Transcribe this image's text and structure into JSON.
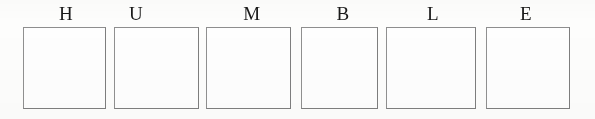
{
  "worksheet": {
    "background_color": "#fdfdfc",
    "border_color": "#8a8a8a",
    "text_color": "#1a1a1a",
    "word": "HUMBLE",
    "slots": [
      {
        "letter": "H",
        "box_value": "",
        "letter_left": 55,
        "letter_width": 22,
        "letter_top": 4,
        "box_left": 23,
        "box_top": 27,
        "box_width": 83,
        "box_height": 82
      },
      {
        "letter": "U",
        "box_value": "",
        "letter_left": 125,
        "letter_width": 22,
        "letter_top": 4,
        "box_left": 114,
        "box_top": 27,
        "box_width": 85,
        "box_height": 82
      },
      {
        "letter": "M",
        "box_value": "",
        "letter_left": 239,
        "letter_width": 26,
        "letter_top": 4,
        "box_left": 206,
        "box_top": 27,
        "box_width": 85,
        "box_height": 82
      },
      {
        "letter": "B",
        "box_value": "",
        "letter_left": 332,
        "letter_width": 22,
        "letter_top": 4,
        "box_left": 301,
        "box_top": 27,
        "box_width": 77,
        "box_height": 82
      },
      {
        "letter": "L",
        "box_value": "",
        "letter_left": 422,
        "letter_width": 22,
        "letter_top": 4,
        "box_left": 386,
        "box_top": 27,
        "box_width": 90,
        "box_height": 82
      },
      {
        "letter": "E",
        "box_value": "",
        "letter_left": 515,
        "letter_width": 22,
        "letter_top": 4,
        "box_left": 486,
        "box_top": 27,
        "box_width": 84,
        "box_height": 82
      }
    ]
  }
}
